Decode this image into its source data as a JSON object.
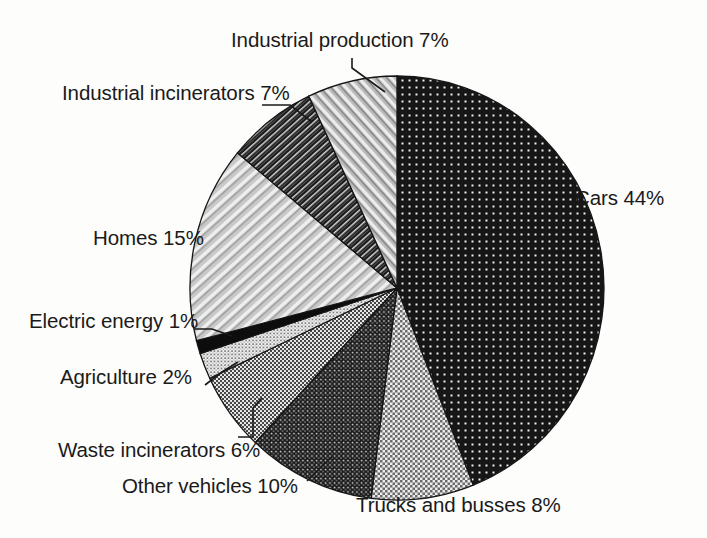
{
  "figure": {
    "background_color": "#fdfdfc",
    "text_color": "#1a1a1a",
    "title": ""
  },
  "chart_data": {
    "type": "pie",
    "title": "",
    "xlabel": "",
    "ylabel": "",
    "grid": false,
    "legend_position": "none",
    "labels_position": "outside-with-leader-lines",
    "start_angle_deg": 0,
    "direction": "clockwise",
    "units": "percent",
    "total": 100,
    "categories": [
      "Cars",
      "Trucks and busses",
      "Other vehicles",
      "Waste incinerators",
      "Agriculture",
      "Electric energy",
      "Homes",
      "Industrial incinerators",
      "Industrial production"
    ],
    "values": [
      44,
      8,
      10,
      6,
      2,
      1,
      15,
      7,
      7
    ],
    "annotations": [
      "Cars 44%",
      "Trucks and busses 8%",
      "Other vehicles 10%",
      "Waste incinerators 6%",
      "Agriculture 2%",
      "Electric energy 1%",
      "Homes 15%",
      "Industrial incinerators 7%",
      "Industrial production 7%"
    ],
    "slices": [
      {
        "label": "Cars",
        "value": 44,
        "text": "Cars 44%",
        "fill": "dark-dot-grid",
        "color": "#1c1c1c"
      },
      {
        "label": "Trucks and busses",
        "value": 8,
        "text": "Trucks and busses 8%",
        "fill": "light-checker",
        "color": "#b9b9b9"
      },
      {
        "label": "Other vehicles",
        "value": 10,
        "text": "Other vehicles 10%",
        "fill": "dark-fine-dot",
        "color": "#2a2a2a"
      },
      {
        "label": "Waste incinerators",
        "value": 6,
        "text": "Waste incinerators 6%",
        "fill": "mid-dot",
        "color": "#6e6e6e"
      },
      {
        "label": "Agriculture",
        "value": 2,
        "text": "Agriculture 2%",
        "fill": "fine-gray-dot",
        "color": "#8a8a8a"
      },
      {
        "label": "Electric energy",
        "value": 1,
        "text": "Electric energy 1%",
        "fill": "solid-black",
        "color": "#0d0d0d"
      },
      {
        "label": "Homes",
        "value": 15,
        "text": "Homes 15%",
        "fill": "light-diagonal-hatch",
        "color": "#a8a8a8"
      },
      {
        "label": "Industrial incinerators",
        "value": 7,
        "text": "Industrial incinerators 7%",
        "fill": "dark-diagonal-hatch",
        "color": "#3a3a3a"
      },
      {
        "label": "Industrial production",
        "value": 7,
        "text": "Industrial production 7%",
        "fill": "mid-diagonal-hatch",
        "color": "#9a9a9a"
      }
    ]
  },
  "labels": {
    "industrial_production": "Industrial production 7%",
    "industrial_incinerators": "Industrial incinerators 7%",
    "homes": "Homes 15%",
    "electric_energy": "Electric energy 1%",
    "agriculture": "Agriculture 2%",
    "waste_incinerators": "Waste incinerators 6%",
    "other_vehicles": "Other vehicles 10%",
    "trucks_and_busses": "Trucks and busses 8%",
    "cars": "Cars 44%"
  }
}
